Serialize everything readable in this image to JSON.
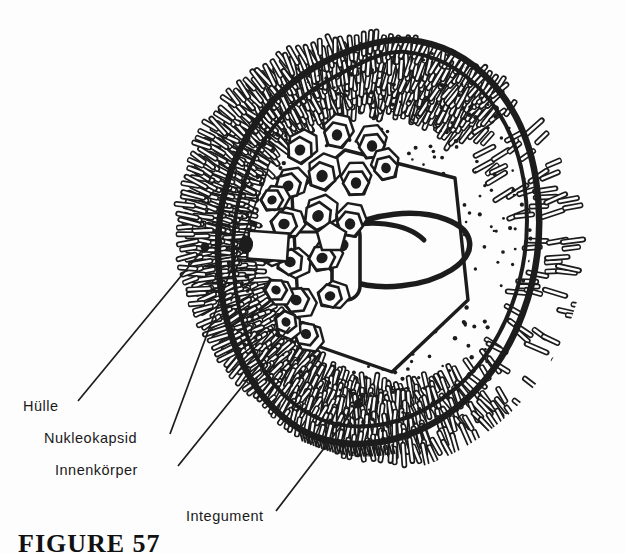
{
  "figure": {
    "caption": "FIGURE 57",
    "background_color": "#fdfdfd",
    "ink_color": "#1a1a1a"
  },
  "labels": [
    {
      "id": "huelle",
      "text": "Hülle",
      "x": 23,
      "y": 398
    },
    {
      "id": "nukleokapsid",
      "text": "Nukleokapsid",
      "x": 44,
      "y": 430
    },
    {
      "id": "innenkoerper",
      "text": "Innenkörper",
      "x": 55,
      "y": 462
    },
    {
      "id": "integument",
      "text": "Integument",
      "x": 186,
      "y": 508
    }
  ],
  "leaders": [
    {
      "id": "leader-huelle",
      "from": [
        78,
        401
      ],
      "to": [
        205,
        247
      ]
    },
    {
      "id": "leader-nukleokapsid",
      "from": [
        170,
        434
      ],
      "to": [
        268,
        170
      ]
    },
    {
      "id": "leader-innenkoerper",
      "from": [
        178,
        466
      ],
      "to": [
        290,
        327
      ]
    },
    {
      "id": "leader-integument",
      "from": [
        276,
        511
      ],
      "to": [
        358,
        404
      ]
    }
  ],
  "structures": {
    "envelope": "Hülle",
    "nucleocapsid": "Nukleokapsid",
    "core_body": "Innenkörper",
    "tegument": "Integument"
  }
}
